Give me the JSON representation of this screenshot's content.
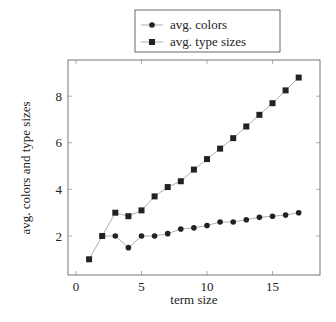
{
  "chart_data": {
    "type": "line",
    "title": "",
    "xlabel": "term size",
    "ylabel": "avg. colors and type sizes",
    "xlim": [
      -0.6,
      18.8
    ],
    "ylim": [
      0.65,
      9.8
    ],
    "xticks": [
      0,
      5,
      10,
      15
    ],
    "yticks": [
      2,
      4,
      6,
      8
    ],
    "grid": false,
    "legend_position": "top-center-outside",
    "x": [
      1,
      2,
      3,
      4,
      5,
      6,
      7,
      8,
      9,
      10,
      11,
      12,
      13,
      14,
      15,
      16,
      17
    ],
    "series": [
      {
        "name": "avg. colors",
        "marker": "circle",
        "x": [
          2,
          3,
          4,
          5,
          6,
          7,
          8,
          9,
          10,
          11,
          12,
          13,
          14,
          15,
          16,
          17
        ],
        "values": [
          2.0,
          2.0,
          1.5,
          2.0,
          2.0,
          2.1,
          2.3,
          2.35,
          2.45,
          2.6,
          2.6,
          2.7,
          2.8,
          2.85,
          2.9,
          3.0
        ]
      },
      {
        "name": "avg. type sizes",
        "marker": "square",
        "x": [
          1,
          2,
          3,
          4,
          5,
          6,
          7,
          8,
          9,
          10,
          11,
          12,
          13,
          14,
          15,
          16,
          17
        ],
        "values": [
          1.0,
          2.0,
          3.0,
          2.85,
          3.1,
          3.7,
          4.1,
          4.35,
          4.85,
          5.3,
          5.75,
          6.2,
          6.7,
          7.2,
          7.7,
          8.25,
          8.8
        ]
      }
    ]
  },
  "legend": {
    "items": [
      {
        "label": "avg. colors"
      },
      {
        "label": "avg. type sizes"
      }
    ]
  },
  "axes": {
    "xlabel": "term size",
    "ylabel": "avg. colors and type sizes"
  },
  "colors": {
    "line": "#999999",
    "marker": "#222222",
    "axis": "#555555"
  }
}
